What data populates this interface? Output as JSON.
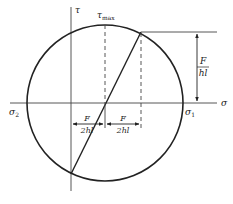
{
  "diagram": {
    "type": "mohr-circle",
    "axes": {
      "horizontal_label": "σ",
      "vertical_label": "τ"
    },
    "labels": {
      "tau_max": {
        "symbol": "τ",
        "subscript": "max"
      },
      "sigma_1": {
        "symbol": "σ",
        "subscript": "1"
      },
      "sigma_2": {
        "symbol": "σ",
        "subscript": "2"
      },
      "vertical_dimension": {
        "numerator": "F",
        "denominator": "hl"
      },
      "left_dimension": {
        "numerator": "F",
        "denominator": "2hl"
      },
      "right_dimension": {
        "numerator": "F",
        "denominator": "2hl"
      }
    },
    "colors": {
      "stroke": "#222222",
      "background": "#ffffff"
    }
  }
}
